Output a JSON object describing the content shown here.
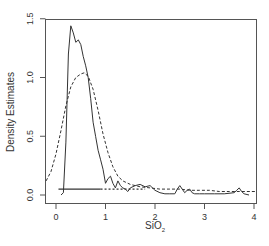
{
  "chart_data": {
    "type": "line",
    "title": "",
    "xlabel": "SiO2",
    "xlabel_main": "SiO",
    "xlabel_sub": "2",
    "ylabel": "Density Estimates",
    "xlim": [
      -0.22,
      4.05
    ],
    "ylim": [
      -0.05,
      1.5
    ],
    "x_ticks": [
      0,
      1,
      2,
      3,
      4
    ],
    "x_tick_labels": [
      "0",
      "1",
      "2",
      "3",
      "4"
    ],
    "y_ticks": [
      0.0,
      0.5,
      1.0,
      1.5
    ],
    "y_tick_labels": [
      "0.0",
      "0.5",
      "1.0",
      "1.5"
    ],
    "grid": false,
    "legend": null,
    "series": [
      {
        "name": "Density estimate (small bandwidth)",
        "style": "solid",
        "color": "#333333",
        "x": [
          0.1,
          0.15,
          0.2,
          0.25,
          0.3,
          0.35,
          0.4,
          0.45,
          0.5,
          0.55,
          0.6,
          0.65,
          0.7,
          0.75,
          0.8,
          0.85,
          0.9,
          0.95,
          1.0,
          1.05,
          1.1,
          1.15,
          1.2,
          1.25,
          1.3,
          1.35,
          1.4,
          1.45,
          1.5,
          1.6,
          1.7,
          1.8,
          1.9,
          2.0,
          2.1,
          2.2,
          2.3,
          2.4,
          2.45,
          2.5,
          2.55,
          2.6,
          2.65,
          2.7,
          2.75,
          2.8,
          2.9,
          3.0,
          3.2,
          3.4,
          3.6,
          3.65,
          3.7,
          3.75,
          3.8,
          3.9
        ],
        "y": [
          0.0,
          0.02,
          0.45,
          1.2,
          1.44,
          1.38,
          1.3,
          1.32,
          1.28,
          1.18,
          1.1,
          1.0,
          0.82,
          0.62,
          0.5,
          0.38,
          0.3,
          0.22,
          0.1,
          0.14,
          0.16,
          0.1,
          0.06,
          0.12,
          0.08,
          0.06,
          0.05,
          0.03,
          0.06,
          0.08,
          0.09,
          0.07,
          0.08,
          0.04,
          0.02,
          0.01,
          0.01,
          0.01,
          0.05,
          0.08,
          0.05,
          0.02,
          0.04,
          0.05,
          0.02,
          0.01,
          0.01,
          0.01,
          0.01,
          0.01,
          0.02,
          0.04,
          0.06,
          0.03,
          0.01,
          0.0
        ]
      },
      {
        "name": "Density estimate (large bandwidth)",
        "style": "dashed",
        "color": "#333333",
        "x": [
          -0.2,
          -0.1,
          0.0,
          0.1,
          0.2,
          0.3,
          0.4,
          0.5,
          0.57,
          0.65,
          0.75,
          0.85,
          0.95,
          1.05,
          1.15,
          1.25,
          1.35,
          1.5,
          1.7,
          1.9,
          2.1,
          2.3,
          2.5,
          2.7,
          2.9,
          3.1,
          3.3,
          3.5,
          3.7,
          3.9,
          4.05
        ],
        "y": [
          0.12,
          0.2,
          0.35,
          0.55,
          0.76,
          0.92,
          1.0,
          1.03,
          1.04,
          1.01,
          0.9,
          0.72,
          0.52,
          0.36,
          0.24,
          0.16,
          0.12,
          0.09,
          0.07,
          0.06,
          0.05,
          0.05,
          0.05,
          0.04,
          0.04,
          0.04,
          0.03,
          0.03,
          0.03,
          0.03,
          0.03
        ]
      },
      {
        "name": "Rug / data points",
        "style": "points",
        "color": "#333333",
        "y_level": 0.05,
        "x_range": [
          0.05,
          1.8
        ]
      }
    ]
  }
}
